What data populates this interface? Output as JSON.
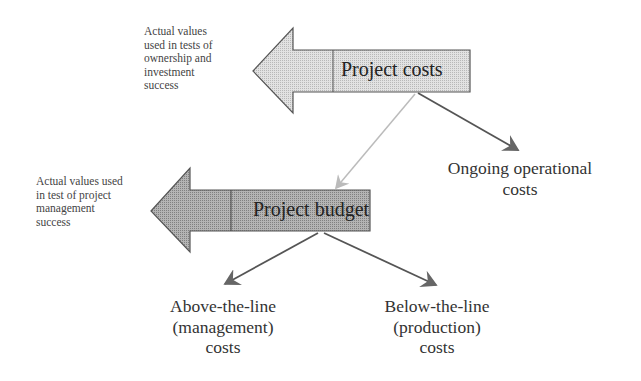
{
  "diagram": {
    "top_arrow": {
      "label": "Project costs",
      "fill": "#d4d4d4",
      "note": "Actual values used in tests of ownership and investment success",
      "note_lines": [
        "Actual values",
        "used in tests of",
        "ownership and",
        "investment",
        "success"
      ]
    },
    "bottom_arrow": {
      "label": "Project budget",
      "fill": "#a6a6a6",
      "note": "Actual values used in test of project management success",
      "note_lines": [
        "Actual values used",
        "in test of project",
        "management",
        "success"
      ]
    },
    "branches": {
      "ongoing": [
        "Ongoing operational",
        "costs"
      ],
      "above": [
        "Above-the-line",
        "(management)",
        "costs"
      ],
      "below": [
        "Below-the-line",
        "(production)",
        "costs"
      ]
    },
    "colors": {
      "outline": "#555555",
      "connector_light": "#b5b5b5",
      "connector_dark": "#555555"
    }
  }
}
